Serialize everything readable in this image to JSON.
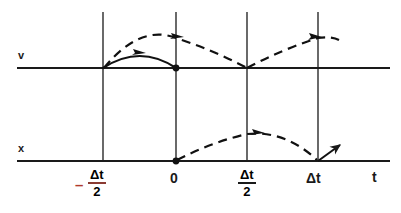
{
  "figure": {
    "ink_color": "#1a1a1a",
    "accent_color": "#b03a2e",
    "background_color": "#ffffff"
  },
  "axes": {
    "v_axis": {
      "label": "v",
      "y_px": 68,
      "x_start_px": 17,
      "x_end_px": 390
    },
    "x_axis": {
      "label": "x",
      "y_px": 161,
      "x_start_px": 17,
      "x_end_px": 390
    },
    "t_axis": {
      "label": "t"
    }
  },
  "gridlines": [
    {
      "name": "gridline-minus-half-dt",
      "x_px": 103,
      "y_top_px": 12,
      "y_bottom_px": 161
    },
    {
      "name": "gridline-zero",
      "x_px": 176,
      "y_top_px": 12,
      "y_bottom_px": 161
    },
    {
      "name": "gridline-half-dt",
      "x_px": 247,
      "y_top_px": 12,
      "y_bottom_px": 161
    },
    {
      "name": "gridline-dt",
      "x_px": 318,
      "y_top_px": 12,
      "y_bottom_px": 161
    }
  ],
  "tick_labels": [
    {
      "name": "tick-minus-half-dt",
      "kind": "fraction",
      "sign": "–",
      "numerator": "Δt",
      "denominator": "2",
      "x_px": 90,
      "y_px": 170
    },
    {
      "name": "tick-zero",
      "kind": "plain",
      "text": "0",
      "x_px": 170,
      "y_px": 172
    },
    {
      "name": "tick-half-dt",
      "kind": "fraction",
      "sign": "",
      "numerator": "Δt",
      "denominator": "2",
      "x_px": 238,
      "y_px": 170
    },
    {
      "name": "tick-dt",
      "kind": "plain",
      "text": "Δt",
      "x_px": 308,
      "y_px": 172
    },
    {
      "name": "tick-t",
      "kind": "plain",
      "text": "t",
      "x_px": 372,
      "y_px": 172
    }
  ],
  "markers": {
    "dot_v_at_zero": {
      "name": "dot-v-axis-origin",
      "x_px": 176,
      "y_px": 68
    },
    "dot_x_at_zero": {
      "name": "dot-x-axis-origin",
      "x_px": 176,
      "y_px": 161
    }
  },
  "curves": [
    {
      "name": "solid-velocity-arc",
      "style": "solid",
      "from": "-Δt/2",
      "to": "0",
      "arrow": "right-at-apex"
    },
    {
      "name": "dashed-velocity-arc-first",
      "style": "dashed",
      "from": "-Δt/2",
      "peak": "0",
      "to": "Δt/2",
      "arrow": "right-at-peak"
    },
    {
      "name": "dashed-velocity-arc-second",
      "style": "dashed",
      "from": "Δt/2",
      "peak": "Δt",
      "to": "beyond Δt",
      "arrow": "right-at-peak"
    },
    {
      "name": "dashed-position-arc",
      "style": "dashed",
      "from": "0",
      "peak": "Δt/2",
      "to": "Δt",
      "arrow": "right-at-peak"
    },
    {
      "name": "straight-exit-arrow",
      "style": "solid",
      "from": "Δt",
      "direction": "up-right"
    }
  ]
}
